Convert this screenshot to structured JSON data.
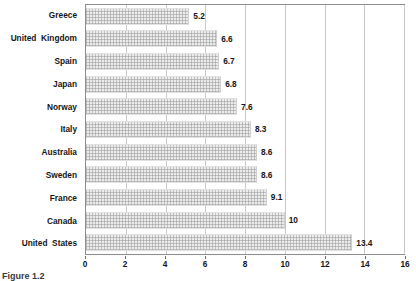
{
  "chart_data": {
    "type": "bar",
    "orientation": "horizontal",
    "title": "",
    "subtitle": "",
    "xlabel": "",
    "ylabel": "",
    "xlim": [
      0,
      16
    ],
    "xticks": [
      0,
      2,
      4,
      6,
      8,
      10,
      12,
      14,
      16
    ],
    "xtick_labels": [
      "0",
      "2",
      "4",
      "6",
      "8",
      "10",
      "12",
      "14",
      "16"
    ],
    "grid": "vertical",
    "legend": "none",
    "categories": [
      "Greece",
      "United  Kingdom",
      "Spain",
      "Japan",
      "Norway",
      "Italy",
      "Australia",
      "Sweden",
      "France",
      "Canada",
      "United  States"
    ],
    "values": [
      5.2,
      6.6,
      6.7,
      6.8,
      7.6,
      8.3,
      8.6,
      8.6,
      9.1,
      10,
      13.4
    ],
    "value_labels": [
      "5.2",
      "6.6",
      "6.7",
      "6.8",
      "7.6",
      "8.3",
      "8.6",
      "8.6",
      "9.1",
      "10",
      "13.4"
    ],
    "series": [
      {
        "name": "",
        "values": [
          5.2,
          6.6,
          6.7,
          6.8,
          7.6,
          8.3,
          8.6,
          8.6,
          9.1,
          10,
          13.4
        ]
      }
    ]
  },
  "figure": {
    "caption": "Figure 1.2",
    "bar_fill_color": "#ececec",
    "bar_edge_color": "#cfcfcf",
    "gridline_color": "#c9c9c9",
    "frame_color": "#8d8d8d",
    "text_color": "#151515"
  }
}
